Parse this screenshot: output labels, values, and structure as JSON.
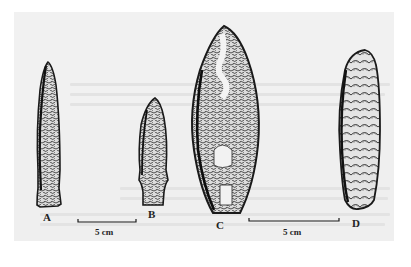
{
  "figure": {
    "background_color": "#f0f0f0",
    "ink_color": "#1e1e1e",
    "specimens": [
      {
        "id": "A",
        "label": "A"
      },
      {
        "id": "B",
        "label": "B"
      },
      {
        "id": "C",
        "label": "C"
      },
      {
        "id": "D",
        "label": "D"
      }
    ],
    "scale_bars": [
      {
        "label": "5 cm"
      },
      {
        "label": "5 cm"
      }
    ]
  }
}
